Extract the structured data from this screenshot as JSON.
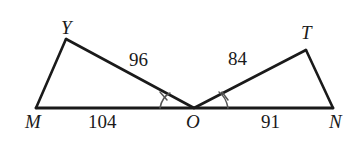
{
  "figure": {
    "type": "geometry-diagram",
    "background_color": "#ffffff",
    "stroke_color": "#1a1a1a",
    "vertices": [
      {
        "name": "Y",
        "label": "Y",
        "x": 66,
        "y": 39
      },
      {
        "name": "T",
        "label": "T",
        "x": 306,
        "y": 50
      },
      {
        "name": "M",
        "label": "M",
        "x": 36,
        "y": 108
      },
      {
        "name": "O",
        "label": "O",
        "x": 194,
        "y": 108
      },
      {
        "name": "N",
        "label": "N",
        "x": 333,
        "y": 108
      }
    ],
    "segments": [
      {
        "name": "MY",
        "from": "M",
        "to": "Y"
      },
      {
        "name": "YO",
        "from": "Y",
        "to": "O"
      },
      {
        "name": "MN",
        "from": "M",
        "to": "N"
      },
      {
        "name": "OT",
        "from": "O",
        "to": "T"
      },
      {
        "name": "TN",
        "from": "T",
        "to": "N"
      }
    ],
    "measures": [
      {
        "name": "YO",
        "value": "96",
        "segment": "YO"
      },
      {
        "name": "OT",
        "value": "84",
        "segment": "OT"
      },
      {
        "name": "MO",
        "value": "104",
        "segment": "MO"
      },
      {
        "name": "ON",
        "value": "91",
        "segment": "ON"
      }
    ],
    "angle_marks": [
      {
        "name": "angle-YOM",
        "vertex": "O",
        "ticks": 1
      },
      {
        "name": "angle-TON",
        "vertex": "O",
        "ticks": 1
      }
    ]
  }
}
